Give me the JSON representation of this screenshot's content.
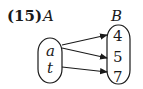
{
  "problem": {
    "number_label": "(15)"
  },
  "sets": {
    "domain": {
      "name": "A",
      "elements": [
        "a",
        "t"
      ]
    },
    "codomain": {
      "name": "B",
      "elements": [
        "4",
        "5",
        "7"
      ]
    }
  },
  "mappings": [
    {
      "from": "a",
      "to": "4"
    },
    {
      "from": "a",
      "to": "5"
    },
    {
      "from": "t",
      "to": "7"
    }
  ],
  "colors": {
    "ink": "#1a1a1a",
    "background": "#ffffff"
  }
}
